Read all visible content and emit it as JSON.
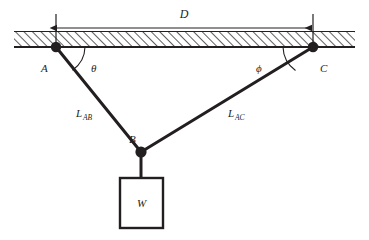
{
  "diagram": {
    "ceiling": {
      "name": "hatched-ceiling",
      "hatch_color": "#000000",
      "line_color": "#231f20"
    },
    "dimension": {
      "label": "D",
      "style": "double-headed-arrow"
    },
    "nodes": [
      {
        "id": "A",
        "label": "A"
      },
      {
        "id": "B",
        "label": "B"
      },
      {
        "id": "C",
        "label": "C"
      }
    ],
    "angles": [
      {
        "id": "theta",
        "label": "θ",
        "at": "A"
      },
      {
        "id": "phi",
        "label": "ϕ",
        "at": "C"
      }
    ],
    "members": [
      {
        "id": "LAB",
        "base": "L",
        "sub": "AB"
      },
      {
        "id": "LAC",
        "base": "L",
        "sub": "AC"
      }
    ],
    "weight": {
      "label": "W"
    },
    "colors": {
      "stroke": "#231f20",
      "text": "#231f20",
      "background": "#ffffff"
    }
  }
}
